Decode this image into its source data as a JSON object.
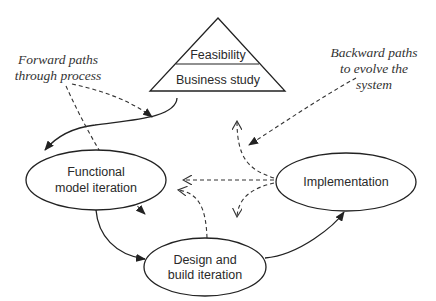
{
  "diagram": {
    "pyramid": {
      "top_label": "Feasibility",
      "bottom_label": "Business study"
    },
    "nodes": [
      {
        "id": "functional",
        "lines": [
          "Functional",
          "model iteration"
        ]
      },
      {
        "id": "design",
        "lines": [
          "Design and",
          "build iteration"
        ]
      },
      {
        "id": "implementation",
        "lines": [
          "Implementation"
        ]
      }
    ],
    "annotations": {
      "forward": {
        "lines": [
          "Forward paths",
          "through process"
        ]
      },
      "backward": {
        "lines": [
          "Backward paths",
          "to evolve the",
          "system"
        ]
      }
    },
    "edges": [
      {
        "from": "Business study",
        "to": "Functional model iteration",
        "style": "solid"
      },
      {
        "from": "Functional model iteration",
        "to": "Design and build iteration",
        "style": "solid"
      },
      {
        "from": "Design and build iteration",
        "to": "Implementation",
        "style": "solid"
      },
      {
        "from": "Implementation",
        "to": "Business study",
        "style": "dashed"
      },
      {
        "from": "Implementation",
        "to": "Functional model iteration",
        "style": "dashed"
      },
      {
        "from": "Implementation",
        "to": "Design and build iteration",
        "style": "dashed"
      },
      {
        "from": "Design and build iteration",
        "to": "Functional model iteration",
        "style": "dashed"
      }
    ],
    "colors": {
      "stroke": "#222222",
      "text": "#2a2a2a",
      "background": "#ffffff"
    }
  }
}
